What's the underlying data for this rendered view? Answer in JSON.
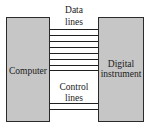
{
  "diagram": {
    "left_block": {
      "label": "Computer"
    },
    "right_block": {
      "label_line1": "Digital",
      "label_line2": "instrument"
    },
    "data_bus": {
      "label_line1": "Data",
      "label_line2": "lines",
      "line_count": 8
    },
    "control_bus": {
      "label_line1": "Control",
      "label_line2": "lines",
      "line_count": 2
    },
    "colors": {
      "block_fill": "#c6c6c6",
      "block_border": "#2a2a2a",
      "line": "#1e1e1e",
      "background": "#ffffff"
    }
  }
}
